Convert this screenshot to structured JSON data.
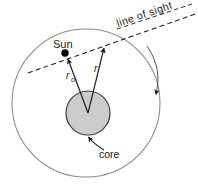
{
  "figure": {
    "background_color": "#ffffff"
  },
  "labels": {
    "sun": "Sun",
    "core": "core",
    "line_of_sight": "line of sight",
    "radius_r": "r",
    "radius_r0_base": "r",
    "radius_r0_sub": "o"
  },
  "colors": {
    "outer_circle_stroke": "#8a8a8a",
    "core_fill": "#cccccc",
    "core_stroke": "#3a3a3a",
    "sun_dot_fill": "#000000",
    "line_of_sight_stroke": "#1a1a1a",
    "arrow_stroke": "#1a1a1a",
    "text_color": "#1a1a1a",
    "rotation_arrow_stroke": "#555555"
  },
  "geometry": {
    "outer_circle": {
      "cx": 86,
      "cy": 103,
      "r": 74
    },
    "core_circle": {
      "cx": 88,
      "cy": 113,
      "r": 22
    },
    "sun_dot": {
      "cx": 65,
      "cy": 53,
      "r": 3.6
    },
    "line_of_sight_start": {
      "x": 30,
      "y": 72
    },
    "line_of_sight_end": {
      "x": 196,
      "y": 13
    },
    "r_vector_tip": {
      "x": 104,
      "y": 46
    },
    "r0_vector_tip": {
      "x": 67,
      "y": 58
    }
  },
  "annotations": {
    "rotation_direction": "clockwise",
    "line_of_sight_angle_deg": -19
  }
}
